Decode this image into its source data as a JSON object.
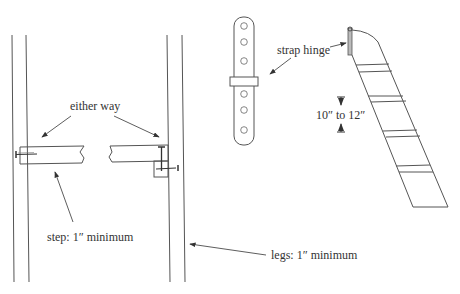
{
  "diagram": {
    "type": "technical line drawing",
    "labels": {
      "either_way": "either way",
      "step": "step: 1″ minimum",
      "legs": "legs: 1″ minimum",
      "strap_hinge": "strap hinge",
      "rung_spacing": "10″ to 12″"
    },
    "components": [
      {
        "name": "left leg",
        "note": "vertical double-line board"
      },
      {
        "name": "right leg",
        "note": "vertical double-line board"
      },
      {
        "name": "step left half",
        "fastener": "nail through leg"
      },
      {
        "name": "step right half",
        "fastener": "screw with cleat block"
      },
      {
        "name": "strap hinge",
        "holes": 6
      },
      {
        "name": "angled ladder",
        "rungs": 4
      }
    ],
    "colors": {
      "line": "#555555",
      "text": "#333333",
      "background": "#ffffff"
    }
  }
}
